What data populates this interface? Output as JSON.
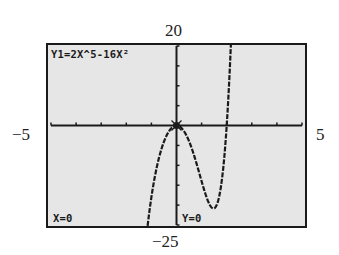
{
  "calculator_screen": {
    "equation_label": "Y1=2X^5-16X²",
    "trace_x_label": "X=0",
    "trace_y_label": "Y=0"
  },
  "window_labels": {
    "ymax": "20",
    "ymin": "−25",
    "xmin": "−5",
    "xmax": "5"
  },
  "colors": {
    "screen_background": "#e6e6e6",
    "pixel_ink": "#1a1a1a",
    "frame": "#1a1a1a"
  },
  "chart_data": {
    "type": "line",
    "function": "y = 2x^5 - 16x^2",
    "xlabel": "",
    "ylabel": "",
    "xlim": [
      -5,
      5
    ],
    "ylim": [
      -25,
      20
    ],
    "x_tick_step": 1,
    "y_tick_step": 5,
    "grid": false,
    "legend": "none",
    "trace_point": {
      "x": 0,
      "y": 0
    },
    "series": [
      {
        "name": "Y1",
        "x": [
          -1.3,
          -1.2,
          -1.1,
          -1.0,
          -0.9,
          -0.8,
          -0.7,
          -0.6,
          -0.5,
          -0.4,
          -0.3,
          -0.2,
          -0.1,
          0,
          0.2,
          0.4,
          0.6,
          0.8,
          1.0,
          1.2,
          1.4,
          1.6,
          1.7,
          1.8,
          1.9,
          2.0,
          2.1,
          2.2
        ],
        "values": [
          -34.47,
          -27.99,
          -22.58,
          -18.0,
          -14.14,
          -10.9,
          -8.18,
          -5.92,
          -4.06,
          -2.58,
          -1.44,
          -0.64,
          -0.16,
          0,
          -0.64,
          -2.54,
          -5.6,
          -9.58,
          -14.0,
          -18.06,
          -20.61,
          -20.0,
          -17.84,
          -13.64,
          -6.24,
          0.0,
          11.4,
          31.0
        ]
      }
    ],
    "annotations": [
      "Y1=2X^5-16X²",
      "X=0",
      "Y=0"
    ]
  }
}
